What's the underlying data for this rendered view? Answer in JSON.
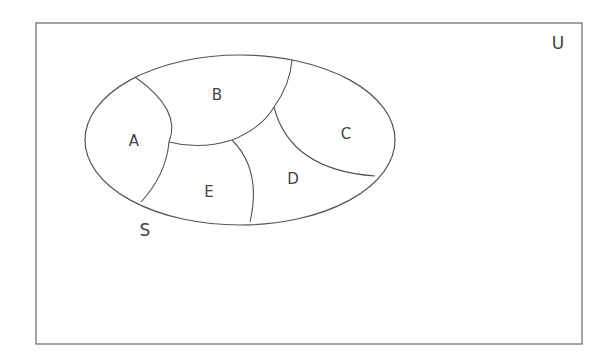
{
  "diagram": {
    "type": "venn-partition",
    "universe_label": "U",
    "set_label": "S",
    "regions": [
      {
        "id": "A",
        "label": "A"
      },
      {
        "id": "B",
        "label": "B"
      },
      {
        "id": "C",
        "label": "C"
      },
      {
        "id": "D",
        "label": "D"
      },
      {
        "id": "E",
        "label": "E"
      }
    ],
    "colors": {
      "line": "#555555",
      "text": "#444444",
      "background": "#ffffff"
    }
  }
}
